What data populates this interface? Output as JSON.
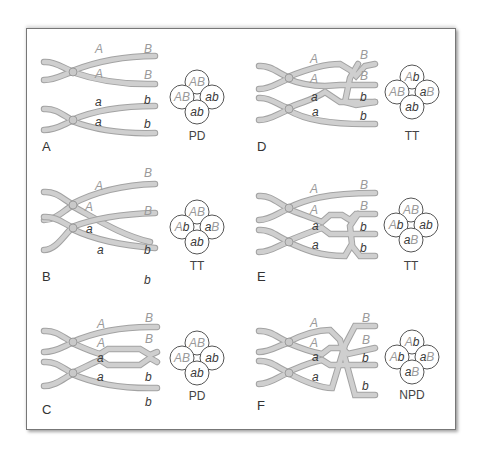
{
  "figure": {
    "panels": [
      {
        "id": "A",
        "label": "A",
        "upper_chromatids": [
          {
            "left": "A",
            "right": "B"
          },
          {
            "left": "A",
            "right": "B"
          }
        ],
        "lower_chromatids": [
          {
            "left": "a",
            "right": "b"
          },
          {
            "left": "a",
            "right": "b"
          }
        ],
        "crossovers": "none",
        "tetrad": {
          "top": "AB",
          "left": "AB",
          "right": "ab",
          "bottom": "ab"
        },
        "type": "PD"
      },
      {
        "id": "B",
        "label": "B",
        "upper_chromatids": [
          {
            "left": "A",
            "right": "B"
          },
          {
            "left": "A",
            "right": "b"
          }
        ],
        "lower_chromatids": [
          {
            "left": "a",
            "right": "B"
          },
          {
            "left": "a",
            "right": "b"
          }
        ],
        "crossovers": "single",
        "tetrad": {
          "top": "AB",
          "left": "Ab",
          "right": "aB",
          "bottom": "ab"
        },
        "type": "TT"
      },
      {
        "id": "C",
        "label": "C",
        "upper_chromatids": [
          {
            "left": "A",
            "right": "B"
          },
          {
            "left": "A",
            "right": "B"
          }
        ],
        "lower_chromatids": [
          {
            "left": "a",
            "right": "b"
          },
          {
            "left": "a",
            "right": "b"
          }
        ],
        "crossovers": "two-strand double",
        "tetrad": {
          "top": "AB",
          "left": "AB",
          "right": "ab",
          "bottom": "ab"
        },
        "type": "PD"
      },
      {
        "id": "D",
        "label": "D",
        "upper_chromatids": [
          {
            "left": "A",
            "right": "B"
          },
          {
            "left": "A",
            "right": "B"
          }
        ],
        "lower_chromatids": [
          {
            "left": "a",
            "right": "b"
          },
          {
            "left": "a",
            "right": "b"
          }
        ],
        "crossovers": "three-strand double",
        "tetrad": {
          "top": "Ab",
          "left": "AB",
          "right": "aB",
          "bottom": "ab"
        },
        "type": "TT"
      },
      {
        "id": "E",
        "label": "E",
        "upper_chromatids": [
          {
            "left": "A",
            "right": "B"
          },
          {
            "left": "A",
            "right": "B"
          }
        ],
        "lower_chromatids": [
          {
            "left": "a",
            "right": "b"
          },
          {
            "left": "a",
            "right": "b"
          }
        ],
        "crossovers": "three-strand double",
        "tetrad": {
          "top": "AB",
          "left": "Ab",
          "right": "ab",
          "bottom": "aB"
        },
        "type": "TT"
      },
      {
        "id": "F",
        "label": "F",
        "upper_chromatids": [
          {
            "left": "A",
            "right": "B"
          },
          {
            "left": "A",
            "right": "B"
          }
        ],
        "lower_chromatids": [
          {
            "left": "a",
            "right": "b"
          },
          {
            "left": "a",
            "right": "b"
          }
        ],
        "crossovers": "four-strand double",
        "tetrad": {
          "top": "Ab",
          "left": "Ab",
          "right": "aB",
          "bottom": "aB"
        },
        "type": "NPD"
      }
    ],
    "colors": {
      "upper_allele_text": "#9a9a9a",
      "lower_allele_text": "#3a3a3a",
      "chromatid_fill": "#c8c8c8",
      "frame_border": "#777777"
    }
  }
}
